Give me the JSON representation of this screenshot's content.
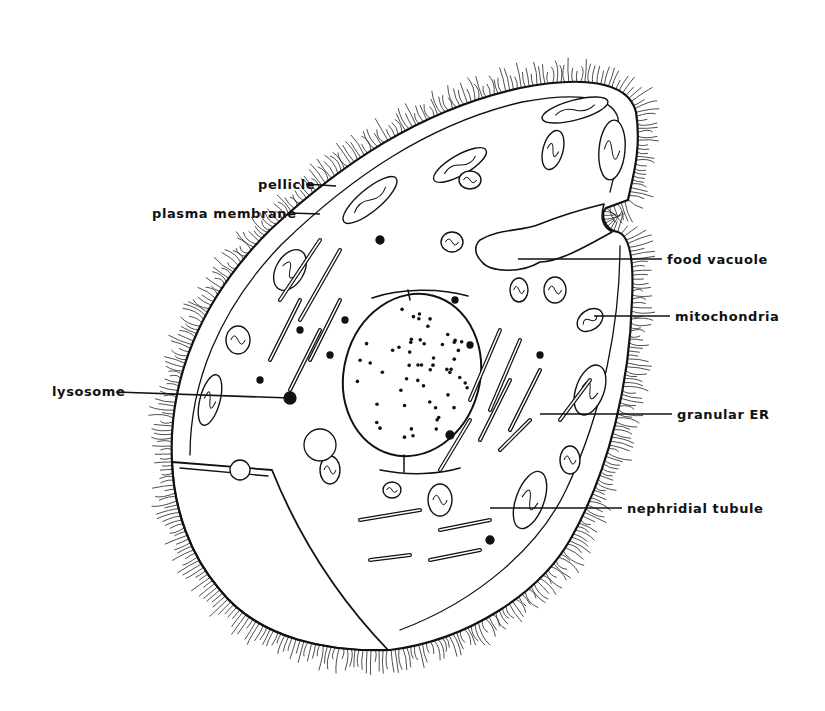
{
  "figure": {
    "ink_color": "#111111",
    "background_color": "#ffffff",
    "labels": [
      {
        "id": "pellicle",
        "text": "pellicle",
        "side": "left"
      },
      {
        "id": "plasma-membrane",
        "text": "plasma membrane",
        "side": "left"
      },
      {
        "id": "food-vacuole",
        "text": "food vacuole",
        "side": "right"
      },
      {
        "id": "mitochondria",
        "text": "mitochondria",
        "side": "right"
      },
      {
        "id": "lysosome",
        "text": "lysosome",
        "side": "left"
      },
      {
        "id": "granular-er",
        "text": "granular ER",
        "side": "right"
      },
      {
        "id": "nephridial-tubule",
        "text": "nephridial tubule",
        "side": "right"
      }
    ]
  }
}
